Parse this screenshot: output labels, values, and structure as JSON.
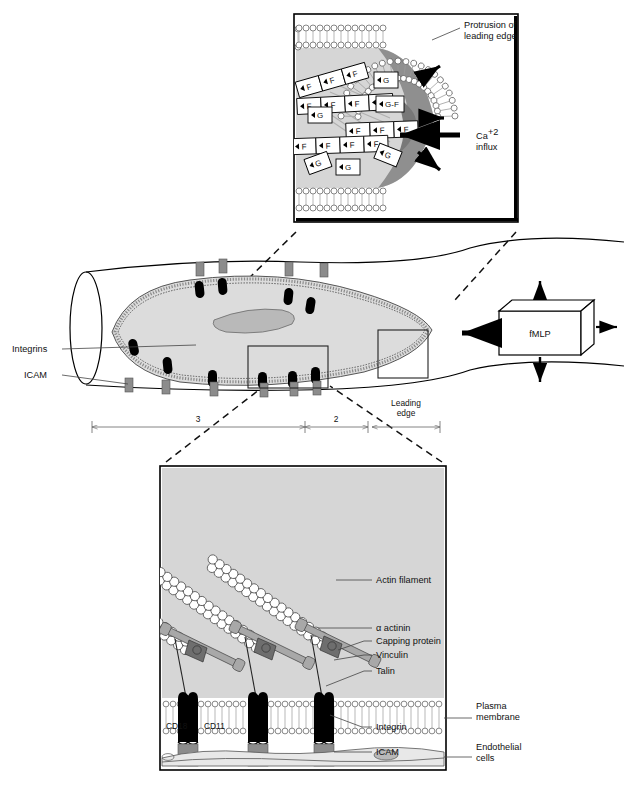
{
  "figure": {
    "panels": [
      "top-leading-edge-inset",
      "middle-vessel-overview",
      "bottom-adhesion-inset"
    ]
  },
  "top_panel": {
    "labels": {
      "protrusion": "Protrusion of\nleading edge",
      "protrusion_line1": "Protrusion of",
      "protrusion_line2": "leading edge",
      "calcium_line1": "Ca",
      "calcium_sup": "+2",
      "calcium_line2": "influx"
    },
    "actin_boxes": {
      "f_label": "F",
      "g_label": "G",
      "gf_label": "G-F",
      "f_count": 11,
      "g_count": 5
    }
  },
  "middle_panel": {
    "labels": {
      "integrins": "Integrins",
      "icam": "ICAM",
      "fmlp": "fMLP",
      "leading_edge_line1": "Leading",
      "leading_edge_line2": "edge"
    },
    "regions": [
      {
        "id": "region-3",
        "label": "3"
      },
      {
        "id": "region-2",
        "label": "2"
      },
      {
        "id": "region-leading-edge",
        "label": "Leading edge"
      }
    ],
    "integrin_count": 9,
    "icam_count": 8
  },
  "bottom_panel": {
    "labels": {
      "actin_filament": "Actin filament",
      "alpha_actinin": "α actinin",
      "capping_protein": "Capping protein",
      "vinculin": "Vinculin",
      "talin": "Talin",
      "cd18": "CD18",
      "cd11": "CD11",
      "integrin": "Integrin",
      "icam": "ICAM",
      "plasma_membrane_line1": "Plasma",
      "plasma_membrane_line2": "membrane",
      "endothelial_line1": "Endothelial",
      "endothelial_line2": "cells"
    },
    "filament_count": 3,
    "adhesion_complex_count": 3
  },
  "colors": {
    "cytoplasm": "#d6d6d6",
    "dark_band": "#8f8f8f",
    "integrin": "#000000",
    "icam": "#8c8c8c",
    "capping_protein": "#6e6e6e",
    "alpha_actinin": "#a8a8a8",
    "stroke": "#000000",
    "background": "#ffffff"
  }
}
